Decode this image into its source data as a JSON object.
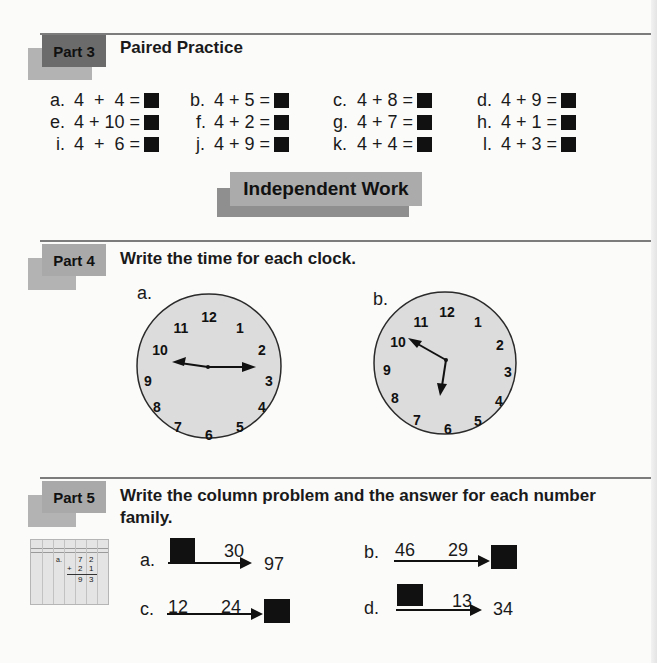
{
  "part3": {
    "tag": "Part 3",
    "title": "Paired Practice",
    "problems": [
      {
        "label": "a.",
        "expr": "4  +  4 ="
      },
      {
        "label": "b.",
        "expr": "4 + 5 ="
      },
      {
        "label": "c.",
        "expr": "4 + 8 ="
      },
      {
        "label": "d.",
        "expr": "4 + 9 ="
      },
      {
        "label": "e.",
        "expr": "4 + 10 ="
      },
      {
        "label": "f.",
        "expr": "4 + 2 ="
      },
      {
        "label": "g.",
        "expr": "4 + 7 ="
      },
      {
        "label": "h.",
        "expr": "4 + 1 ="
      },
      {
        "label": "i.",
        "expr": "4  +  6 ="
      },
      {
        "label": "j.",
        "expr": "4 + 9 ="
      },
      {
        "label": "k.",
        "expr": "4 + 4 ="
      },
      {
        "label": "l.",
        "expr": "4 + 3 ="
      }
    ]
  },
  "banner": {
    "label": "Independent Work"
  },
  "part4": {
    "tag": "Part 4",
    "title": "Write the time for each clock.",
    "clocks": [
      {
        "label": "a.",
        "hour_hand_points_to": 9,
        "minute_hand_points_to": 3,
        "numerals": [
          "12",
          "1",
          "2",
          "3",
          "4",
          "5",
          "6",
          "7",
          "8",
          "9",
          "10",
          "11"
        ]
      },
      {
        "label": "b.",
        "hour_hand_points_to": 10,
        "minute_hand_points_to": 6,
        "numerals": [
          "12",
          "1",
          "2",
          "3",
          "4",
          "5",
          "6",
          "7",
          "8",
          "9",
          "10",
          "11"
        ]
      }
    ]
  },
  "part5": {
    "tag": "Part 5",
    "title_line1": "Write the column problem and the answer for each number",
    "title_line2": "family.",
    "example": {
      "label": "a.",
      "top": [
        "7",
        "2"
      ],
      "add": [
        "+",
        "2",
        "1"
      ],
      "sum": [
        "9",
        "3"
      ]
    },
    "families": [
      {
        "label": "a.",
        "first": "",
        "second": "30",
        "total": "97",
        "first_blank": true,
        "total_blank": false
      },
      {
        "label": "b.",
        "first": "46",
        "second": "29",
        "total": "",
        "first_blank": false,
        "total_blank": true
      },
      {
        "label": "c.",
        "first": "12",
        "second": "24",
        "total": "",
        "first_blank": false,
        "total_blank": true
      },
      {
        "label": "d.",
        "first": "",
        "second": "13",
        "total": "34",
        "first_blank": true,
        "total_blank": false
      }
    ]
  }
}
